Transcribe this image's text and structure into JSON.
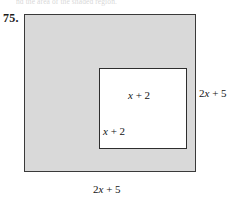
{
  "header": {
    "cropped_text": "nd the area of the shaded region."
  },
  "problem": {
    "number": "75."
  },
  "figure": {
    "outer_square": {
      "shape": "square",
      "fill_color": "#d9d9d9",
      "stroke_color": "#3a3a3a",
      "side_expression": "2x + 5",
      "labels": {
        "right": {
          "coefficient": "2",
          "variable": "x",
          "operator": "+",
          "constant": "5"
        },
        "bottom": {
          "coefficient": "2",
          "variable": "x",
          "operator": "+",
          "constant": "5"
        }
      }
    },
    "inner_square": {
      "shape": "square",
      "fill_color": "#ffffff",
      "stroke_color": "#2e2e2e",
      "side_expression": "x + 2",
      "labels": {
        "right": {
          "coefficient": "",
          "variable": "x",
          "operator": "+",
          "constant": "2"
        },
        "bottom": {
          "coefficient": "",
          "variable": "x",
          "operator": "+",
          "constant": "2"
        }
      }
    }
  }
}
